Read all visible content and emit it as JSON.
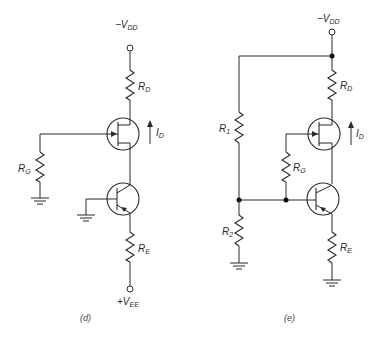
{
  "figure": {
    "panels": [
      {
        "id": "d",
        "caption": "(d)",
        "supply_top": {
          "sign": "−",
          "main": "V",
          "sub": "DD"
        },
        "supply_bottom": {
          "sign": "+",
          "main": "V",
          "sub": "EE"
        },
        "components": {
          "rd": {
            "main": "R",
            "sub": "D"
          },
          "rg": {
            "main": "R",
            "sub": "G"
          },
          "re": {
            "main": "R",
            "sub": "E"
          },
          "id": {
            "main": "I",
            "sub": "D"
          }
        }
      },
      {
        "id": "e",
        "caption": "(e)",
        "supply_top": {
          "sign": "−",
          "main": "V",
          "sub": "DD"
        },
        "components": {
          "r1": {
            "main": "R",
            "sub": "1"
          },
          "r2": {
            "main": "R",
            "sub": "2"
          },
          "rd": {
            "main": "R",
            "sub": "D"
          },
          "rg": {
            "main": "R",
            "sub": "G"
          },
          "re": {
            "main": "R",
            "sub": "E"
          },
          "id": {
            "main": "I",
            "sub": "D"
          }
        }
      }
    ]
  },
  "colors": {
    "ink": "#2a2a2a",
    "background": "#ffffff"
  }
}
